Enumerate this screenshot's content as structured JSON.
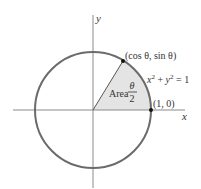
{
  "diagram": {
    "type": "unit-circle",
    "axes": {
      "x_label": "x",
      "y_label": "y"
    },
    "circle_equation": {
      "lhs_x": "x",
      "sup1": "2",
      "plus": " + ",
      "lhs_y": "y",
      "sup2": "2",
      "rhs": " = 1"
    },
    "point_on_circle": "(cos θ, sin θ)",
    "point_axis": "(1, 0)",
    "sector_label": {
      "word": "Area",
      "numerator": "θ",
      "denominator": "2"
    },
    "colors": {
      "circle": "#6b6b6b",
      "sector_fill": "#e4e4e4",
      "axes": "#8a8a8a",
      "points": "#111111"
    }
  }
}
